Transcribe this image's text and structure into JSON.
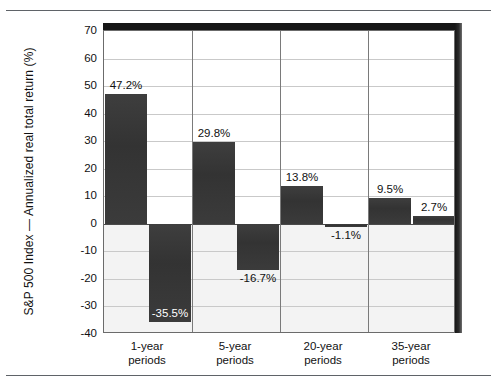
{
  "figure": {
    "ylabel": "S&P 500 Index — Annualized real total return (%)"
  },
  "chart_data": {
    "type": "bar",
    "title": "",
    "xlabel": "",
    "ylabel": "S&P 500 Index — Annualized real total return (%)",
    "ylim": [
      -40,
      70
    ],
    "yticks": [
      70,
      60,
      50,
      40,
      30,
      20,
      10,
      0,
      -10,
      -20,
      -30,
      -40
    ],
    "ytick_labels": [
      "70",
      "60",
      "50",
      "40",
      "30",
      "20",
      "10",
      "0",
      "-10",
      "-20",
      "-30",
      "-40"
    ],
    "grid": true,
    "legend": false,
    "categories": [
      "1-year periods",
      "5-year periods",
      "20-year periods",
      "35-year periods"
    ],
    "category_lines": [
      [
        "1-year",
        "periods"
      ],
      [
        "5-year",
        "periods"
      ],
      [
        "20-year",
        "periods"
      ],
      [
        "35-year",
        "periods"
      ]
    ],
    "series": [
      {
        "name": "Best",
        "values": [
          47.2,
          29.8,
          13.8,
          9.5
        ],
        "labels": [
          "47.2%",
          "29.8%",
          "13.8%",
          "9.5%"
        ]
      },
      {
        "name": "Worst",
        "values": [
          -35.5,
          -16.7,
          -1.1,
          2.7
        ],
        "labels": [
          "-35.5%",
          "-16.7%",
          "-1.1%",
          "2.7%"
        ]
      }
    ],
    "bar_color": "#3a3a3a",
    "zero_line": 0
  }
}
